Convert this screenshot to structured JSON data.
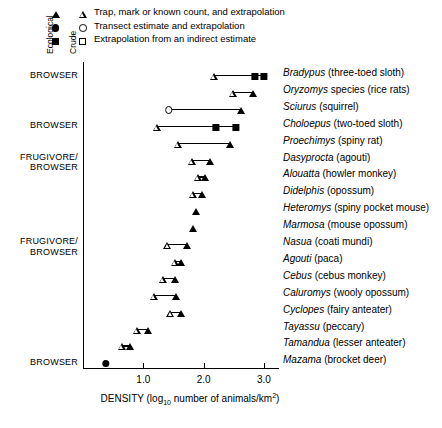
{
  "legend": {
    "axis_labels": {
      "ecological": "Ecological",
      "crude": "Crude"
    },
    "rows": [
      {
        "ecological_marker": "filled-triangle",
        "crude_marker": "open-triangle",
        "text": "Trap, mark or known count, and extrapolation"
      },
      {
        "ecological_marker": "filled-circle",
        "crude_marker": "open-circle",
        "text": "Transect estimate and extrapolation"
      },
      {
        "ecological_marker": "filled-square",
        "crude_marker": "open-square",
        "text": "Extrapolation from an indirect estimate"
      }
    ]
  },
  "chart_data": {
    "type": "scatter",
    "title": "",
    "xlabel": "DENSITY (log10 number of animals/km2)",
    "xlabel_parts": {
      "prefix": "DENSITY (log",
      "sub": "10",
      "mid": " number of animals/km",
      "sup": "2",
      "suffix": ")"
    },
    "ylabel": "",
    "xlim": [
      0.0,
      3.25
    ],
    "xticks": [
      1.0,
      2.0,
      3.0
    ],
    "xticklabels": [
      "1.0",
      "2.0",
      "3.0"
    ],
    "grid": false,
    "legend_position": "top-left",
    "group_labels": [
      {
        "label": "BROWSER",
        "row": 0
      },
      {
        "label": "BROWSER",
        "row": 3
      },
      {
        "label": "FRUGIVORE/\nBROWSER",
        "line1": "FRUGIVORE/",
        "line2": "BROWSER",
        "row": 5
      },
      {
        "label": "FRUGIVORE/\nBROWSER",
        "line1": "FRUGIVORE/",
        "line2": "BROWSER",
        "row": 10
      },
      {
        "label": "BROWSER",
        "row": 17
      }
    ],
    "rows": [
      {
        "species": "Bradypus",
        "common": "(three-toed sloth)",
        "crude": 2.17,
        "crude_marker": "open-triangle",
        "ecological": [
          2.85,
          3.0
        ],
        "eco_marker": "filled-square"
      },
      {
        "species": "Oryzomys",
        "common": "species (rice rats)",
        "crude": 2.48,
        "crude_marker": "open-triangle",
        "ecological": [
          2.82
        ],
        "eco_marker": "filled-triangle",
        "genus_suffix": " species"
      },
      {
        "species": "Sciurus",
        "common": "(squirrel)",
        "crude": 1.42,
        "crude_marker": "open-circle",
        "ecological": [
          2.62
        ],
        "eco_marker": "filled-triangle"
      },
      {
        "species": "Choloepus",
        "common": "(two-toed sloth)",
        "crude": 1.22,
        "crude_marker": "open-triangle",
        "ecological": [
          2.2,
          2.53
        ],
        "eco_marker": "filled-square"
      },
      {
        "species": "Proechimys",
        "common": "(spiny rat)",
        "crude": 1.57,
        "crude_marker": "open-triangle",
        "ecological": [
          2.43
        ],
        "eco_marker": "filled-triangle"
      },
      {
        "species": "Dasyprocta",
        "common": "(agouti)",
        "crude": 1.8,
        "crude_marker": "open-triangle",
        "ecological": [
          2.1
        ],
        "eco_marker": "filled-triangle"
      },
      {
        "species": "Alouatta",
        "common": "(howler monkey)",
        "crude": 1.9,
        "crude_marker": "open-triangle",
        "ecological": [
          2.02
        ],
        "eco_marker": "filled-triangle"
      },
      {
        "species": "Didelphis",
        "common": "(opossum)",
        "crude": 1.83,
        "crude_marker": "open-triangle",
        "ecological": [
          1.97
        ],
        "eco_marker": "filled-triangle"
      },
      {
        "species": "Heteromys",
        "common": "(spiny pocket mouse)",
        "crude": null,
        "crude_marker": null,
        "ecological": [
          1.88
        ],
        "eco_marker": "filled-triangle"
      },
      {
        "species": "Marmosa",
        "common": "(mouse opossum)",
        "crude": null,
        "crude_marker": null,
        "ecological": [
          1.83
        ],
        "eco_marker": "filled-triangle"
      },
      {
        "species": "Nasua",
        "common": "(coati mundi)",
        "crude": 1.4,
        "crude_marker": "open-triangle",
        "ecological": [
          1.73
        ],
        "eco_marker": "filled-triangle"
      },
      {
        "species": "Agouti",
        "common": "(paca)",
        "crude": 1.52,
        "crude_marker": "open-triangle",
        "ecological": [
          1.63
        ],
        "eco_marker": "filled-triangle"
      },
      {
        "species": "Cebus",
        "common": "(cebus monkey)",
        "crude": 1.32,
        "crude_marker": "open-triangle",
        "ecological": [
          1.52
        ],
        "eco_marker": "filled-triangle"
      },
      {
        "species": "Caluromys",
        "common": "(wooly opossum)",
        "crude": 1.17,
        "crude_marker": "open-triangle",
        "ecological": [
          1.55
        ],
        "eco_marker": "filled-triangle"
      },
      {
        "species": "Cyclopes",
        "common": "(fairy anteater)",
        "crude": 1.45,
        "crude_marker": "open-triangle",
        "ecological": [
          1.62
        ],
        "eco_marker": "filled-triangle"
      },
      {
        "species": "Tayassu",
        "common": "(peccary)",
        "crude": 0.9,
        "crude_marker": "open-triangle",
        "ecological": [
          1.07
        ],
        "eco_marker": "filled-triangle"
      },
      {
        "species": "Tamandua",
        "common": "(lesser anteater)",
        "crude": 0.65,
        "crude_marker": "open-triangle",
        "ecological": [
          0.78
        ],
        "eco_marker": "filled-triangle"
      },
      {
        "species": "Mazama",
        "common": "(brocket deer)",
        "crude": null,
        "crude_marker": null,
        "ecological": [
          0.38
        ],
        "eco_marker": "filled-circle"
      }
    ]
  }
}
